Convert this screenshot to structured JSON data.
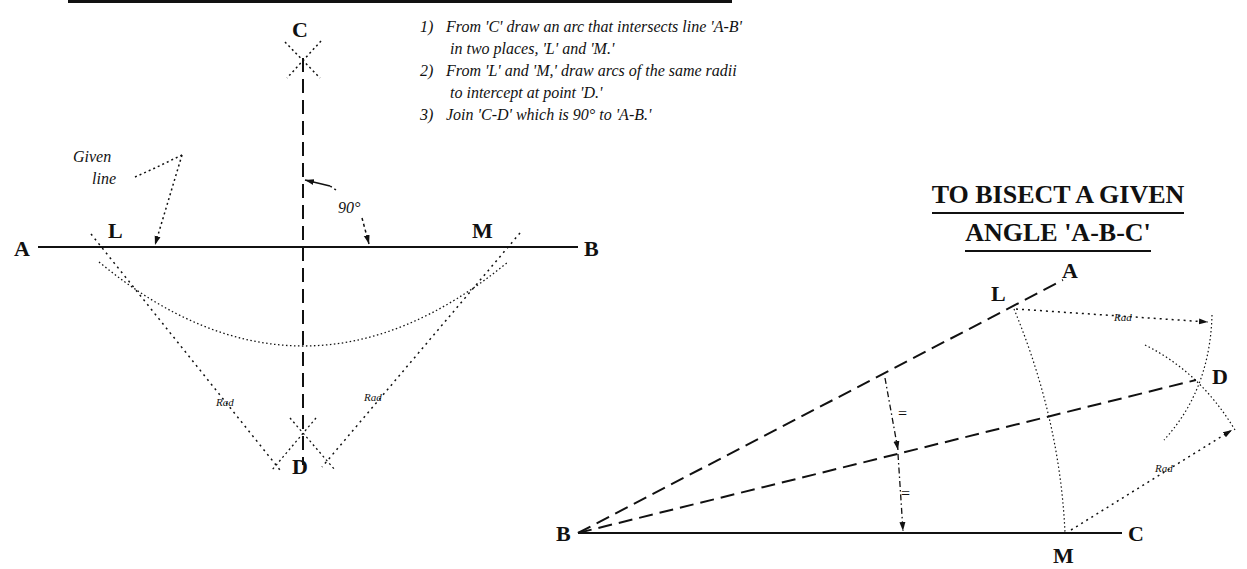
{
  "left_figure": {
    "title_bar": "",
    "points": {
      "A": "A",
      "B": "B",
      "C": "C",
      "D": "D",
      "L": "L",
      "M": "M"
    },
    "given_line_label": [
      "Given",
      "line"
    ],
    "angle_label": "90°",
    "rad_labels": [
      "Rad",
      "Rad"
    ]
  },
  "instructions": [
    {
      "num": "1)",
      "line1": "From 'C' draw an arc that intersects line 'A-B'",
      "line2": "in two places, 'L' and 'M.'"
    },
    {
      "num": "2)",
      "line1": "From 'L' and 'M,' draw arcs of the same radii",
      "line2": "to intercept at point 'D.'"
    },
    {
      "num": "3)",
      "line1": "Join 'C-D' which is 90° to 'A-B.'",
      "line2": ""
    }
  ],
  "right_figure": {
    "title_line1": "TO BISECT A GIVEN",
    "title_line2": "ANGLE 'A-B-C'",
    "points": {
      "A": "A",
      "B": "B",
      "C": "C",
      "D": "D",
      "L": "L",
      "M": "M"
    },
    "equal_marks": [
      "=",
      "="
    ],
    "rad_labels": [
      "Rad",
      "Rad"
    ]
  }
}
